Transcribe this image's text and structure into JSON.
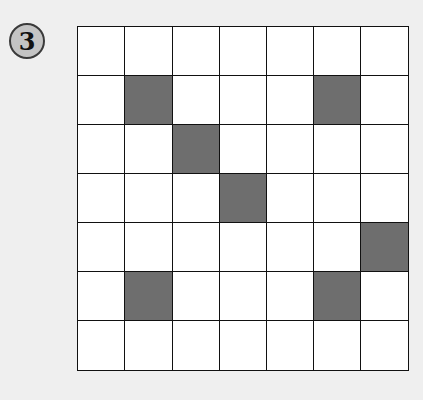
{
  "badge": {
    "label": "3"
  },
  "grid": {
    "rows": 7,
    "cols": 7,
    "shaded_color": "#6e6e6e",
    "shaded_cells": [
      [
        1,
        1
      ],
      [
        1,
        5
      ],
      [
        2,
        2
      ],
      [
        3,
        3
      ],
      [
        4,
        6
      ],
      [
        5,
        1
      ],
      [
        5,
        5
      ]
    ]
  }
}
